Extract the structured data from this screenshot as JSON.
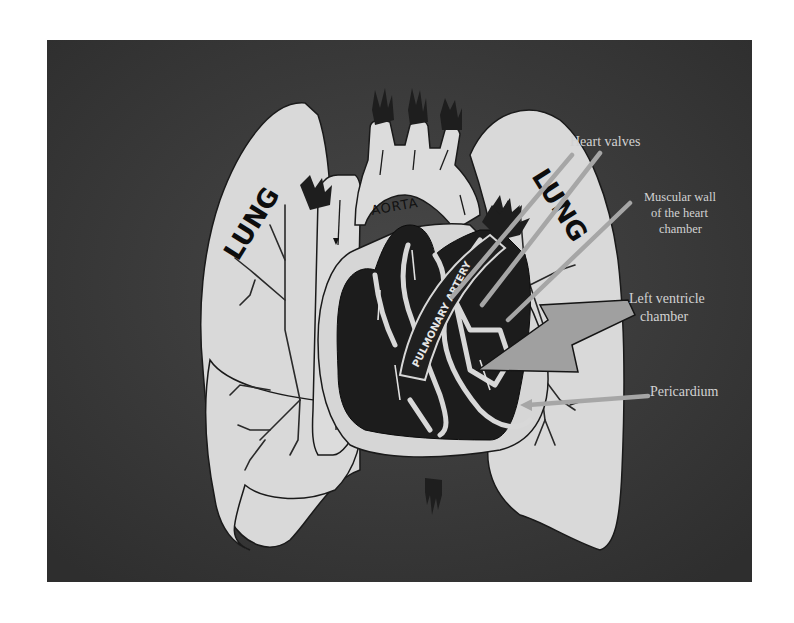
{
  "diagram": {
    "colors": {
      "page_background": "#ffffff",
      "panel_background": "#3a3a3a",
      "organ_fill": "#d9d9d9",
      "heart_fill": "#1c1c1c",
      "pointer_color": "#a6a6a6",
      "label_color": "#d2d2d2"
    },
    "organ_labels": {
      "left_lung": "LUNG",
      "right_lung": "LUNG",
      "aorta": "AORTA",
      "pulmonary_artery": "PULMONARY ARTERY"
    },
    "callouts": {
      "heart_valves": "Heart valves",
      "muscular_wall_line1": "Muscular wall",
      "muscular_wall_line2": "of the heart",
      "muscular_wall_line3": "chamber",
      "left_ventricle_line1": "Left ventricle",
      "left_ventricle_line2": "chamber",
      "pericardium": "Pericardium"
    }
  }
}
